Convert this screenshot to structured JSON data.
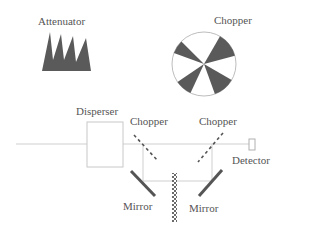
{
  "labels": {
    "attenuator": "Attenuator",
    "chopper_top": "Chopper",
    "disperser": "Disperser",
    "chopper_left": "Chopper",
    "chopper_right": "Chopper",
    "detector": "Detector",
    "mirror_left": "Mirror",
    "mirror_right": "Mirror"
  },
  "colors": {
    "dark_fill": "#5a5a5a",
    "line": "#c8c8c8",
    "mirror": "#555555",
    "text": "#555555"
  }
}
